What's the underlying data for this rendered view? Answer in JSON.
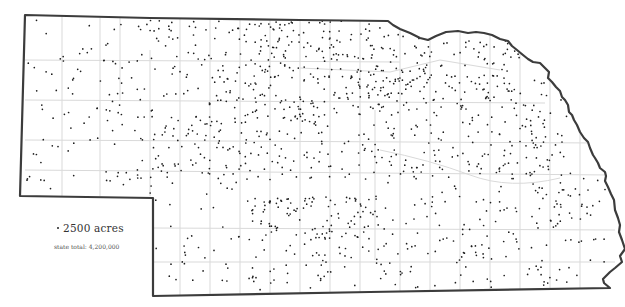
{
  "map": {
    "subject": "Nebraska",
    "colors": {
      "background": "#ffffff",
      "border": "#3c3c3c",
      "county_lines": "#d9d9d9",
      "dots": "#1e1e1e"
    },
    "state_outline": [
      [
        25,
        15
      ],
      [
        150,
        18
      ],
      [
        300,
        20
      ],
      [
        388,
        21
      ],
      [
        393,
        25
      ],
      [
        400,
        29
      ],
      [
        410,
        33
      ],
      [
        420,
        38
      ],
      [
        428,
        40
      ],
      [
        436,
        36
      ],
      [
        446,
        32
      ],
      [
        458,
        31
      ],
      [
        468,
        33
      ],
      [
        476,
        32
      ],
      [
        484,
        33
      ],
      [
        492,
        35
      ],
      [
        500,
        39
      ],
      [
        508,
        41
      ],
      [
        512,
        46
      ],
      [
        517,
        50
      ],
      [
        523,
        55
      ],
      [
        528,
        59
      ],
      [
        533,
        62
      ],
      [
        540,
        63
      ],
      [
        545,
        68
      ],
      [
        549,
        72
      ],
      [
        548,
        78
      ],
      [
        552,
        82
      ],
      [
        556,
        87
      ],
      [
        560,
        91
      ],
      [
        562,
        97
      ],
      [
        565,
        100
      ],
      [
        568,
        105
      ],
      [
        569,
        112
      ],
      [
        572,
        115
      ],
      [
        574,
        120
      ],
      [
        577,
        125
      ],
      [
        580,
        132
      ],
      [
        584,
        138
      ],
      [
        588,
        142
      ],
      [
        590,
        148
      ],
      [
        593,
        155
      ],
      [
        595,
        158
      ],
      [
        598,
        163
      ],
      [
        600,
        168
      ],
      [
        605,
        172
      ],
      [
        606,
        176
      ],
      [
        605,
        181
      ],
      [
        608,
        187
      ],
      [
        611,
        194
      ],
      [
        614,
        200
      ],
      [
        615,
        210
      ],
      [
        618,
        218
      ],
      [
        620,
        225
      ],
      [
        619,
        232
      ],
      [
        622,
        240
      ],
      [
        625,
        249
      ],
      [
        620,
        256
      ],
      [
        622,
        262
      ],
      [
        615,
        268
      ],
      [
        610,
        272
      ],
      [
        606,
        276
      ],
      [
        603,
        279
      ],
      [
        604,
        283
      ],
      [
        610,
        288
      ],
      [
        370,
        292
      ],
      [
        153,
        296
      ],
      [
        153,
        198
      ],
      [
        20,
        196
      ],
      [
        25,
        15
      ]
    ],
    "county_lines": [
      "M62,17 L62,196",
      "M100,18 L100,196",
      "M120,18 L120,100",
      "M150,50 L150,196",
      "M180,18 L180,296",
      "M210,19 L210,296",
      "M240,19 L240,296",
      "M270,20 L270,296",
      "M300,20 L300,296",
      "M330,20 L330,296",
      "M360,21 L360,296",
      "M375,110 L375,260",
      "M400,30 L400,296",
      "M430,40 L430,296",
      "M460,33 L460,296",
      "M490,35 L490,296",
      "M520,52 L520,296",
      "M550,75 L550,292",
      "M580,130 L580,290",
      "M25,60 L400,62",
      "M25,100 L545,103",
      "M25,140 L600,143",
      "M25,170 L610,175",
      "M153,228 L615,230",
      "M153,262 L615,262",
      "M380,150 Q430,160 470,175 T560,178",
      "M300,68 L390,72 L440,60 L500,70"
    ],
    "legend": {
      "dot_value": "2500 acres",
      "state_total": "state total: 4,200,000"
    },
    "dots": {
      "seed": 7,
      "regions": [
        {
          "x": 27,
          "y": 20,
          "w": 125,
          "h": 174,
          "count": 105
        },
        {
          "x": 150,
          "y": 20,
          "w": 110,
          "h": 80,
          "count": 90
        },
        {
          "x": 260,
          "y": 20,
          "w": 160,
          "h": 90,
          "count": 250
        },
        {
          "x": 420,
          "y": 40,
          "w": 100,
          "h": 70,
          "count": 110
        },
        {
          "x": 150,
          "y": 100,
          "w": 120,
          "h": 80,
          "count": 120
        },
        {
          "x": 270,
          "y": 100,
          "w": 150,
          "h": 80,
          "count": 120
        },
        {
          "x": 420,
          "y": 110,
          "w": 130,
          "h": 70,
          "count": 95
        },
        {
          "x": 520,
          "y": 80,
          "w": 50,
          "h": 80,
          "count": 30
        },
        {
          "x": 155,
          "y": 180,
          "w": 100,
          "h": 110,
          "count": 40
        },
        {
          "x": 250,
          "y": 195,
          "w": 130,
          "h": 45,
          "count": 110
        },
        {
          "x": 250,
          "y": 240,
          "w": 130,
          "h": 50,
          "count": 45
        },
        {
          "x": 380,
          "y": 180,
          "w": 120,
          "h": 108,
          "count": 85
        },
        {
          "x": 500,
          "y": 180,
          "w": 105,
          "h": 106,
          "count": 70
        },
        {
          "x": 555,
          "y": 170,
          "w": 50,
          "h": 60,
          "count": 18
        }
      ]
    }
  }
}
